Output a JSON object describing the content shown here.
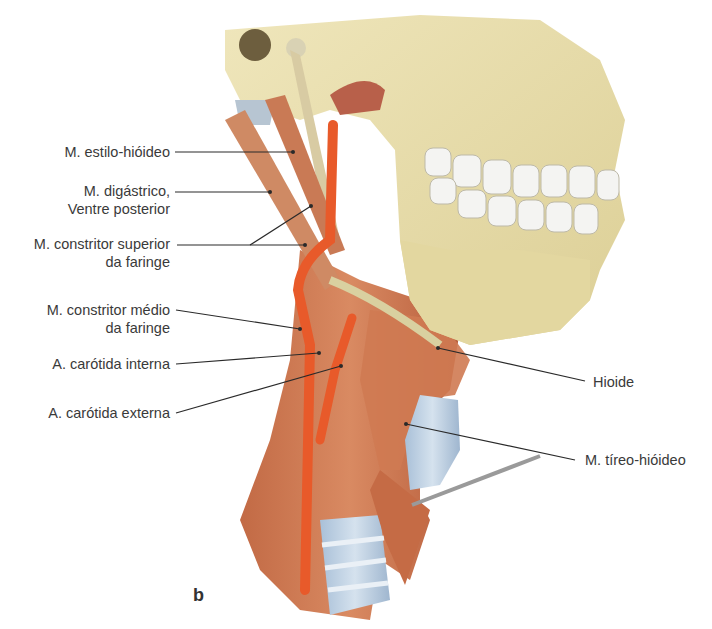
{
  "figure": {
    "panel_letter": "b",
    "colors": {
      "bone": "#e8dfae",
      "bone_shadow": "#c9bd86",
      "teeth": "#f4f4f2",
      "muscle": "#c96d47",
      "muscle_light": "#d98e66",
      "artery": "#e85a2a",
      "cartilage": "#b9cde0",
      "leader_line": "#2a2a2a",
      "label_text": "#3a3a3a"
    },
    "labels_left": [
      {
        "id": "estilo-hioideo",
        "lines": [
          "M. estilo-hióideo"
        ]
      },
      {
        "id": "digastrico",
        "lines": [
          "M. digástrico,",
          "Ventre posterior"
        ]
      },
      {
        "id": "constritor-superior",
        "lines": [
          "M. constritor superior",
          "da faringe"
        ]
      },
      {
        "id": "constritor-medio",
        "lines": [
          "M. constritor médio",
          "da faringe"
        ]
      },
      {
        "id": "carotida-interna",
        "lines": [
          "A. carótida interna"
        ]
      },
      {
        "id": "carotida-externa",
        "lines": [
          "A. carótida externa"
        ]
      }
    ],
    "labels_right": [
      {
        "id": "hioide",
        "lines": [
          "Hioide"
        ]
      },
      {
        "id": "tireo-hioideo",
        "lines": [
          "M. tíreo-hióideo"
        ]
      }
    ]
  }
}
